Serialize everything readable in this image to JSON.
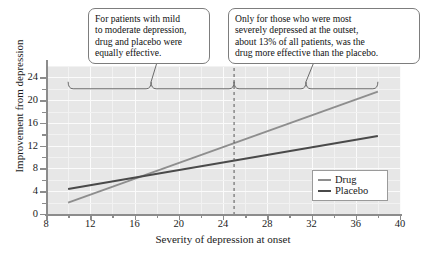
{
  "chart_data": {
    "type": "line",
    "title": "",
    "xlabel": "Severity of depression at onset",
    "ylabel": "Improvement from depression",
    "xlim": [
      8,
      40
    ],
    "ylim": [
      0,
      26
    ],
    "xticks": [
      8,
      12,
      16,
      20,
      24,
      28,
      32,
      36,
      40
    ],
    "xtick_labels": [
      "8",
      "12",
      "16",
      "20",
      "24",
      "28",
      "32",
      "36",
      "40"
    ],
    "xminor_step": 2,
    "yticks": [
      0,
      4,
      8,
      12,
      16,
      20,
      24
    ],
    "ytick_labels": [
      "0",
      "4",
      "8",
      "12",
      "16",
      "20",
      "24"
    ],
    "yminor_step": 2,
    "grid": true,
    "grid_color": "#fbfbfb",
    "plot_background": "#e7e7e7",
    "legend_position": "lower right",
    "series": [
      {
        "name": "Drug",
        "color": "#8e8e8e",
        "x": [
          10,
          38
        ],
        "values": [
          2.0,
          21.5
        ]
      },
      {
        "name": "Placebo",
        "color": "#4a4a4a",
        "x": [
          10,
          38
        ],
        "values": [
          4.4,
          13.7
        ]
      }
    ],
    "crossover_point": {
      "x": 17.0,
      "y": 6.7
    },
    "annotations": [
      {
        "name": "threshold-line",
        "type": "vertical-dashed-line",
        "x": 25,
        "color": "#555555"
      },
      {
        "name": "bracket-left",
        "type": "curly-brace",
        "x_start": 10,
        "x_end": 25,
        "y": 22
      },
      {
        "name": "bracket-right",
        "type": "curly-brace",
        "x_start": 25,
        "x_end": 38,
        "y": 22
      }
    ]
  },
  "legend": {
    "items": [
      {
        "label": "Drug",
        "color": "#8e8e8e"
      },
      {
        "label": "Placebo",
        "color": "#4a4a4a"
      }
    ]
  },
  "callouts": {
    "left": {
      "lines": [
        "For patients with mild",
        "to moderate depression,",
        "drug and placebo were",
        "equally effective."
      ]
    },
    "right": {
      "lines": [
        "Only for those who were most",
        "severely depressed at the outset,",
        "about 13% of all patients, was the",
        "drug more effective than the placebo."
      ]
    }
  }
}
